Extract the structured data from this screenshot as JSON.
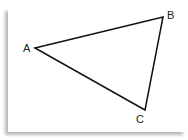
{
  "diagram": {
    "type": "triangle",
    "vertices": [
      {
        "label": "A",
        "x": 35,
        "y": 48,
        "lx": 23,
        "ly": 52
      },
      {
        "label": "B",
        "x": 163,
        "y": 17,
        "lx": 167,
        "ly": 19
      },
      {
        "label": "C",
        "x": 145,
        "y": 110,
        "lx": 136,
        "ly": 123
      }
    ],
    "stroke_color": "#111111",
    "background": "#ffffff"
  }
}
